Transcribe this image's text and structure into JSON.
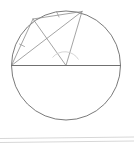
{
  "canvas": {
    "width": 134,
    "height": 149,
    "background": "#ffffff",
    "title": "inscribed-angle-circle-diagram"
  },
  "style": {
    "circle_stroke": "#6b6b6b",
    "circle_width": 0.9,
    "chord_stroke": "#8d8d8d",
    "chord_width": 0.8,
    "diameter_stroke": "#707070",
    "diameter_width": 1.1,
    "arc_mark_stroke": "#c9c9c9",
    "arc_mark_width": 0.8,
    "tick_stroke": "#9a9a9a",
    "tick_width": 0.8,
    "rule_stroke": "#d7d7d7",
    "rule_width": 1.0,
    "fill": "none"
  },
  "circle": {
    "name": "main-circle",
    "cx": 66,
    "cy": 65.5,
    "r": 54.5
  },
  "points": [
    {
      "id": "L",
      "label": "left-diameter-endpoint",
      "x": 11.5,
      "y": 65.5
    },
    {
      "id": "R",
      "label": "right-diameter-endpoint",
      "x": 120.5,
      "y": 65.5
    },
    {
      "id": "A",
      "label": "upper-left-arc-point",
      "x": 33.0,
      "y": 19.0
    },
    {
      "id": "B",
      "label": "upper-right-arc-point",
      "x": 82.0,
      "y": 11.5
    },
    {
      "id": "V",
      "label": "diameter-vertex",
      "x": 66.0,
      "y": 65.5
    }
  ],
  "segments": [
    {
      "name": "diameter-chord",
      "x1": 11.5,
      "y1": 65.5,
      "x2": 120.5,
      "y2": 65.5,
      "kind": "diameter"
    },
    {
      "name": "chord-left-to-a",
      "x1": 11.5,
      "y1": 65.5,
      "x2": 33.0,
      "y2": 19.0,
      "kind": "chord",
      "ticks": 1
    },
    {
      "name": "chord-a-to-b",
      "x1": 33.0,
      "y1": 19.0,
      "x2": 82.0,
      "y2": 11.5,
      "kind": "chord",
      "ticks": 1
    },
    {
      "name": "chord-left-to-b",
      "x1": 11.5,
      "y1": 65.5,
      "x2": 82.0,
      "y2": 11.5,
      "kind": "chord",
      "ticks": 0
    },
    {
      "name": "chord-a-to-vertex",
      "x1": 33.0,
      "y1": 19.0,
      "x2": 66.0,
      "y2": 65.5,
      "kind": "chord",
      "ticks": 0
    },
    {
      "name": "chord-b-to-vertex",
      "x1": 82.0,
      "y1": 11.5,
      "x2": 66.0,
      "y2": 65.5,
      "kind": "chord",
      "ticks": 0
    }
  ],
  "angle_marks": [
    {
      "name": "vertex-angle-arc",
      "path": "M 52.5 57.5 A 16 16 0 0 1 78.5 59.5",
      "at_point": "V"
    }
  ],
  "tick_marks": [
    {
      "name": "tick-chord-left-to-a",
      "x1": 19.5,
      "y1": 44.0,
      "x2": 24.5,
      "y2": 46.5
    },
    {
      "name": "tick-chord-a-to-b",
      "x1": 56.5,
      "y1": 11.5,
      "x2": 59.0,
      "y2": 17.0
    }
  ],
  "baseline_rules": [
    {
      "name": "page-rule-upper",
      "x1": 0,
      "y1": 138.5,
      "x2": 134,
      "y2": 137.0
    },
    {
      "name": "page-rule-lower",
      "x1": 0,
      "y1": 142.5,
      "x2": 134,
      "y2": 141.0
    }
  ]
}
